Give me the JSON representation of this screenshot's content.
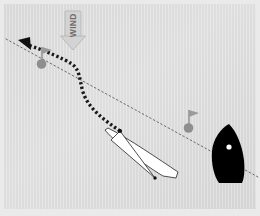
{
  "figure": {
    "type": "diagram",
    "background_color": "#dcdcdc",
    "frame_color": "#e8e8e8",
    "canvas": {
      "width": 260,
      "height": 216
    }
  },
  "wind": {
    "label": "WIND",
    "direction": "down",
    "arrow_color": "#d2d2d2",
    "arrow_stroke": "#a8a8a8",
    "text_color": "#6f6f6f",
    "position": {
      "x": 73,
      "y": 30
    }
  },
  "layline": {
    "name": "layline",
    "style": "dotted",
    "color": "#6a6a6a",
    "from": {
      "x": 8,
      "y": 40
    },
    "to": {
      "x": 256,
      "y": 176
    }
  },
  "track": {
    "name": "boat-track",
    "style": "thick-dashed",
    "color": "#1a1a1a",
    "arrowhead": {
      "x": 20,
      "y": 41,
      "color": "#111111"
    },
    "points": [
      {
        "x": 120,
        "y": 131
      },
      {
        "x": 98,
        "y": 116
      },
      {
        "x": 86,
        "y": 100
      },
      {
        "x": 82,
        "y": 84
      },
      {
        "x": 80,
        "y": 72
      },
      {
        "x": 73,
        "y": 64
      },
      {
        "x": 62,
        "y": 59
      },
      {
        "x": 48,
        "y": 53
      },
      {
        "x": 28,
        "y": 45
      }
    ]
  },
  "marks": [
    {
      "name": "mark-buoy-left",
      "x": 41,
      "y": 63,
      "radius": 5,
      "buoy_color": "#8c8c8c",
      "pole_color": "#8c8c8c",
      "flag_color": "#8c8c8c",
      "pole_height": 14
    },
    {
      "name": "mark-buoy-right",
      "x": 188,
      "y": 126,
      "radius": 5,
      "buoy_color": "#8c8c8c",
      "pole_color": "#8c8c8c",
      "flag_color": "#8c8c8c",
      "pole_height": 14
    }
  ],
  "boats": [
    {
      "name": "white-boat",
      "fill": "#ffffff",
      "stroke": "#3a3a3a",
      "hull_points": "114,128 150,152 172,169 176,176 160,180 132,166 107,140 104,131",
      "sail_points": "120,131 152,177 112,141",
      "mast_dot": {
        "x": 120,
        "y": 131,
        "r": 2.2,
        "color": "#111111"
      },
      "stern_dot": {
        "x": 153,
        "y": 177,
        "r": 1.8,
        "color": "#111111"
      }
    },
    {
      "name": "black-boat",
      "fill": "#000000",
      "stroke": "#000000",
      "hull_points": "228,125 237,132 243,145 245,163 243,178 237,182 220,181 213,172 211,155 215,138 221,129",
      "port_dot": {
        "x": 228,
        "y": 147,
        "r": 2.6,
        "color": "#ffffff"
      }
    }
  ]
}
